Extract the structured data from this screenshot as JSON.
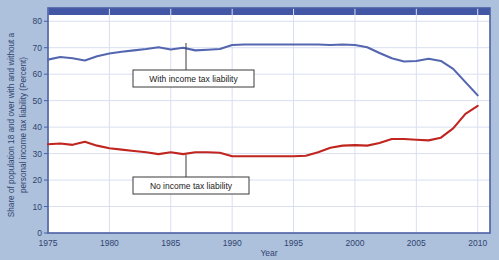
{
  "figure": {
    "background_color": "#aec1dc",
    "plot_background_color": "#ffffff",
    "plot_border_color": "#4a5fa5",
    "grid_color": "#d8dff0",
    "header_bar_color": "#4356a6"
  },
  "chart_data": {
    "type": "line",
    "title": "",
    "subtitle": "",
    "xlabel": "Year",
    "ylabel": "Share of population 18 and over with and without a personal income tax liability (Percent)",
    "xlim": [
      1975,
      2011
    ],
    "ylim": [
      0,
      85
    ],
    "xticks": [
      1975,
      1980,
      1985,
      1990,
      1995,
      2000,
      2005,
      2010
    ],
    "xtick_labels": [
      "1975",
      "1980",
      "1985",
      "1990",
      "1995",
      "2000",
      "2005",
      "2010"
    ],
    "yticks": [
      0,
      10,
      20,
      30,
      40,
      50,
      60,
      70,
      80
    ],
    "ytick_labels": [
      "0",
      "10",
      "20",
      "30",
      "40",
      "50",
      "60",
      "70",
      "80"
    ],
    "grid": true,
    "grid_axis": "both",
    "legend": "none",
    "x": [
      1975,
      1976,
      1977,
      1978,
      1979,
      1980,
      1981,
      1982,
      1983,
      1984,
      1985,
      1986,
      1987,
      1988,
      1989,
      1990,
      1991,
      1992,
      1993,
      1994,
      1995,
      1996,
      1997,
      1998,
      1999,
      2000,
      2001,
      2002,
      2003,
      2004,
      2005,
      2006,
      2007,
      2008,
      2009,
      2010
    ],
    "series": [
      {
        "name": "With income tax liability",
        "color": "#5566b0",
        "values": [
          65.5,
          66.5,
          66.0,
          65.2,
          66.8,
          67.8,
          68.5,
          69.0,
          69.5,
          70.2,
          69.3,
          70.0,
          69.0,
          69.2,
          69.5,
          71.0,
          71.2,
          71.2,
          71.2,
          71.2,
          71.2,
          71.2,
          71.2,
          71.0,
          71.2,
          71.0,
          70.2,
          68.0,
          66.0,
          64.8,
          65.0,
          65.8,
          65.0,
          62.0,
          57.0,
          52.0
        ]
      },
      {
        "name": "No income tax liability",
        "color": "#c0251f",
        "values": [
          33.5,
          33.8,
          33.3,
          34.5,
          33.0,
          32.0,
          31.5,
          31.0,
          30.5,
          29.8,
          30.5,
          29.8,
          30.5,
          30.5,
          30.3,
          29.0,
          29.0,
          29.0,
          29.0,
          29.0,
          29.0,
          29.2,
          30.5,
          32.2,
          33.0,
          33.2,
          33.0,
          34.0,
          35.5,
          35.5,
          35.2,
          35.0,
          36.0,
          39.5,
          45.0,
          48.0
        ]
      }
    ],
    "annotations": [
      {
        "name": "with-income-tax-liability",
        "text": "With income tax liability",
        "box_x": 133,
        "box_y": 70,
        "box_width": 121,
        "box_height": 17,
        "leader_x": 186,
        "leader_top": 43,
        "leader_bottom": 70,
        "series": "With income tax liability"
      },
      {
        "name": "no-income-tax-liability",
        "text": "No income tax liability",
        "box_x": 133,
        "box_y": 177,
        "box_width": 116,
        "box_height": 17,
        "leader_x": 186,
        "leader_top": 155,
        "leader_bottom": 177,
        "series": "No income tax liability"
      }
    ]
  }
}
